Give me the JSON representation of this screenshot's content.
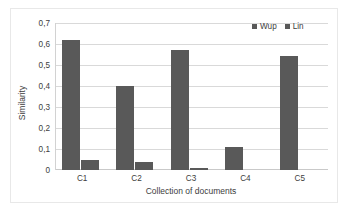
{
  "chart_data": {
    "type": "bar",
    "title": "",
    "xlabel": "Collection of documents",
    "ylabel": "Similarity",
    "categories": [
      "C1",
      "C2",
      "C3",
      "C4",
      "C5"
    ],
    "series": [
      {
        "name": "Wup",
        "color": "#595959",
        "values": [
          0.62,
          0.4,
          0.57,
          0.11,
          0.545
        ]
      },
      {
        "name": "Lin",
        "color": "#595959",
        "values": [
          0.047,
          0.037,
          0.011,
          0,
          0
        ]
      }
    ],
    "ylim": [
      0,
      0.7
    ],
    "ytick_values": [
      0.7,
      0.6,
      0.5,
      0.4,
      0.3,
      0.2,
      0.1,
      0
    ],
    "ytick_labels": [
      "0,7",
      "0,6",
      "0,5",
      "0,4",
      "0,3",
      "0,2",
      "0,1",
      "0"
    ],
    "grid": "horizontal",
    "legend_position": "top-right",
    "decimal_separator": ","
  },
  "legend": {
    "entries": [
      {
        "label": "Wup"
      },
      {
        "label": "Lin"
      }
    ]
  },
  "axes": {
    "y_title": "Similarity",
    "x_title": "Collection of documents"
  },
  "colors": {
    "bar": "#595959",
    "gridline": "#d9d9d9",
    "frame": "#e8e8e8",
    "text": "#3d3d3d",
    "background": "#ffffff"
  }
}
